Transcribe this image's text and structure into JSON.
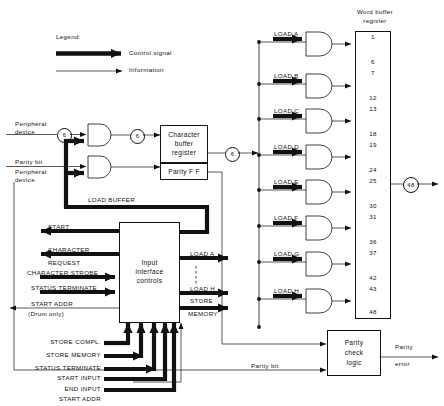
{
  "diagram": {
    "legend": {
      "heading": "Legend:",
      "control_signal": "Control signal",
      "information": "Information"
    },
    "left_inputs": {
      "peripheral_device_1": "Peripheral\ndevice",
      "peripheral_device_1_line1": "Peripheral",
      "peripheral_device_1_line2": "device",
      "parity_bit": "Parity bit",
      "peripheral_device_2_line1": "Peripheral",
      "peripheral_device_2_line2": "device"
    },
    "bus_labels": {
      "six_a": "6",
      "six_b": "6",
      "six_c": "6",
      "forty_eight": "48"
    },
    "blocks": {
      "character_buffer_register": "Character\nbuffer\nregister",
      "character_buffer_l1": "Character",
      "character_buffer_l2": "buffer",
      "character_buffer_l3": "register",
      "parity_ff": "Parity F F",
      "input_interface_controls_l1": "Input",
      "input_interface_controls_l2": "interface",
      "input_interface_controls_l3": "controls",
      "parity_check_logic_l1": "Parity",
      "parity_check_logic_l2": "check",
      "parity_check_logic_l3": "logic"
    },
    "load_buffer_label": "LOAD BUFFER",
    "controls_outputs_left": [
      "START",
      "CHARACTER",
      "REQUEST",
      "CHARACTER STROBE",
      "STATUS TERMINATE",
      "START ADDR",
      "(Drum only)"
    ],
    "controls_outputs_right": [
      "LOAD A",
      "LOAD H",
      "STORE",
      "MEMORY"
    ],
    "controls_inputs_bottom": [
      "STORE COMPL.",
      "STORE MEMORY",
      "STATUS TERMINATE",
      "START INPUT",
      "END INPUT",
      "START ADDR",
      "(Drum only)"
    ],
    "gates": [
      {
        "label": "LOAD A"
      },
      {
        "label": "LOAD B"
      },
      {
        "label": "LOAD C"
      },
      {
        "label": "LOAD D"
      },
      {
        "label": "LOAD E"
      },
      {
        "label": "LOAD F"
      },
      {
        "label": "LOAD G"
      },
      {
        "label": "LOAD H"
      }
    ],
    "word_buffer_register": {
      "title_l1": "Word buffer",
      "title_l2": "register",
      "cells": [
        {
          "top": "1",
          "bottom": "6"
        },
        {
          "top": "7",
          "bottom": "12"
        },
        {
          "top": "13",
          "bottom": "18"
        },
        {
          "top": "19",
          "bottom": "24"
        },
        {
          "top": "25",
          "bottom": "30"
        },
        {
          "top": "31",
          "bottom": "36"
        },
        {
          "top": "37",
          "bottom": "42"
        },
        {
          "top": "43",
          "bottom": "48"
        }
      ]
    },
    "parity_section": {
      "parity_bit": "Parity bit",
      "parity_error_l1": "Parity",
      "parity_error_l2": "error"
    }
  }
}
